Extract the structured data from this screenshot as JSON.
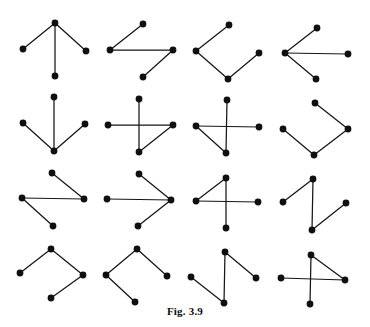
{
  "figure": {
    "caption": "Fig. 3.9",
    "canvas": {
      "width": 370,
      "height": 327
    },
    "style": {
      "vertex_color": "#101010",
      "edge_color": "#151515",
      "background_color": "#ffffff",
      "vertex_radius": 3.4,
      "edge_width": 1.25
    },
    "grid": {
      "rows": 4,
      "columns": 4
    },
    "graphs": [
      {
        "id": "graph-1",
        "row": 1,
        "column": 1,
        "shape": "star-down",
        "vertices": [
          {
            "name": "apex",
            "x": 55,
            "y": 23
          },
          {
            "name": "left",
            "x": 23,
            "y": 49
          },
          {
            "name": "right",
            "x": 86,
            "y": 51
          },
          {
            "name": "bottom",
            "x": 55,
            "y": 76
          }
        ],
        "edges": [
          [
            0,
            1
          ],
          [
            0,
            2
          ],
          [
            0,
            3
          ]
        ]
      },
      {
        "id": "graph-2",
        "row": 1,
        "column": 2,
        "shape": "zigzag-path",
        "vertices": [
          {
            "name": "top",
            "x": 143,
            "y": 24
          },
          {
            "name": "left",
            "x": 110,
            "y": 50
          },
          {
            "name": "right",
            "x": 173,
            "y": 50
          },
          {
            "name": "bottom",
            "x": 143,
            "y": 77
          }
        ],
        "edges": [
          [
            0,
            1
          ],
          [
            1,
            2
          ],
          [
            2,
            3
          ]
        ]
      },
      {
        "id": "graph-3",
        "row": 1,
        "column": 3,
        "shape": "open-v-path",
        "vertices": [
          {
            "name": "top",
            "x": 229,
            "y": 25
          },
          {
            "name": "left",
            "x": 196,
            "y": 51
          },
          {
            "name": "bottom",
            "x": 228,
            "y": 79
          },
          {
            "name": "right",
            "x": 259,
            "y": 53
          }
        ],
        "edges": [
          [
            0,
            1
          ],
          [
            1,
            2
          ],
          [
            2,
            3
          ]
        ]
      },
      {
        "id": "graph-4",
        "row": 1,
        "column": 4,
        "shape": "star-right",
        "vertices": [
          {
            "name": "center",
            "x": 285,
            "y": 53
          },
          {
            "name": "top",
            "x": 317,
            "y": 28
          },
          {
            "name": "right",
            "x": 348,
            "y": 54
          },
          {
            "name": "bottom",
            "x": 316,
            "y": 79
          }
        ],
        "edges": [
          [
            0,
            1
          ],
          [
            0,
            2
          ],
          [
            0,
            3
          ]
        ]
      },
      {
        "id": "graph-5",
        "row": 2,
        "column": 1,
        "shape": "star-up",
        "vertices": [
          {
            "name": "center",
            "x": 54,
            "y": 151
          },
          {
            "name": "top",
            "x": 54,
            "y": 97
          },
          {
            "name": "left",
            "x": 23,
            "y": 123
          },
          {
            "name": "right",
            "x": 85,
            "y": 124
          }
        ],
        "edges": [
          [
            0,
            1
          ],
          [
            0,
            2
          ],
          [
            0,
            3
          ]
        ]
      },
      {
        "id": "graph-6",
        "row": 2,
        "column": 2,
        "shape": "crossed-path",
        "vertices": [
          {
            "name": "top",
            "x": 139,
            "y": 99
          },
          {
            "name": "left",
            "x": 108,
            "y": 125
          },
          {
            "name": "right",
            "x": 173,
            "y": 125
          },
          {
            "name": "bottom",
            "x": 139,
            "y": 152
          }
        ],
        "edges": [
          [
            0,
            3
          ],
          [
            1,
            2
          ],
          [
            2,
            3
          ]
        ]
      },
      {
        "id": "graph-7",
        "row": 2,
        "column": 3,
        "shape": "crossed-path",
        "vertices": [
          {
            "name": "top",
            "x": 227,
            "y": 100
          },
          {
            "name": "left",
            "x": 196,
            "y": 126
          },
          {
            "name": "right",
            "x": 259,
            "y": 127
          },
          {
            "name": "bottom",
            "x": 226,
            "y": 153
          }
        ],
        "edges": [
          [
            0,
            3
          ],
          [
            1,
            2
          ],
          [
            1,
            3
          ]
        ]
      },
      {
        "id": "graph-8",
        "row": 2,
        "column": 4,
        "shape": "open-v-path",
        "vertices": [
          {
            "name": "top",
            "x": 315,
            "y": 103
          },
          {
            "name": "right",
            "x": 348,
            "y": 129
          },
          {
            "name": "bottom",
            "x": 314,
            "y": 155
          },
          {
            "name": "left",
            "x": 283,
            "y": 129
          }
        ],
        "edges": [
          [
            0,
            1
          ],
          [
            1,
            2
          ],
          [
            2,
            3
          ]
        ]
      },
      {
        "id": "graph-9",
        "row": 3,
        "column": 1,
        "shape": "zigzag-path",
        "vertices": [
          {
            "name": "top",
            "x": 52,
            "y": 173
          },
          {
            "name": "right",
            "x": 84,
            "y": 199
          },
          {
            "name": "left",
            "x": 22,
            "y": 198
          },
          {
            "name": "bottom",
            "x": 53,
            "y": 226
          }
        ],
        "edges": [
          [
            0,
            1
          ],
          [
            1,
            2
          ],
          [
            2,
            3
          ]
        ]
      },
      {
        "id": "graph-10",
        "row": 3,
        "column": 2,
        "shape": "star-left",
        "vertices": [
          {
            "name": "center",
            "x": 171,
            "y": 200
          },
          {
            "name": "top",
            "x": 139,
            "y": 174
          },
          {
            "name": "left",
            "x": 107,
            "y": 199
          },
          {
            "name": "bottom",
            "x": 138,
            "y": 226
          }
        ],
        "edges": [
          [
            0,
            1
          ],
          [
            0,
            2
          ],
          [
            0,
            3
          ]
        ]
      },
      {
        "id": "graph-11",
        "row": 3,
        "column": 3,
        "shape": "crossed-path",
        "vertices": [
          {
            "name": "top",
            "x": 226,
            "y": 178
          },
          {
            "name": "left",
            "x": 196,
            "y": 201
          },
          {
            "name": "right",
            "x": 258,
            "y": 202
          },
          {
            "name": "bottom",
            "x": 226,
            "y": 228
          }
        ],
        "edges": [
          [
            0,
            3
          ],
          [
            1,
            2
          ],
          [
            0,
            1
          ]
        ]
      },
      {
        "id": "graph-12",
        "row": 3,
        "column": 4,
        "shape": "zigzag-path",
        "vertices": [
          {
            "name": "top",
            "x": 313,
            "y": 179
          },
          {
            "name": "left",
            "x": 283,
            "y": 202
          },
          {
            "name": "bottom",
            "x": 312,
            "y": 230
          },
          {
            "name": "right",
            "x": 346,
            "y": 203
          }
        ],
        "edges": [
          [
            1,
            0
          ],
          [
            0,
            2
          ],
          [
            2,
            3
          ]
        ]
      },
      {
        "id": "graph-13",
        "row": 4,
        "column": 1,
        "shape": "open-v-path",
        "vertices": [
          {
            "name": "left",
            "x": 20,
            "y": 273
          },
          {
            "name": "top",
            "x": 51,
            "y": 249
          },
          {
            "name": "right",
            "x": 83,
            "y": 275
          },
          {
            "name": "bottom",
            "x": 51,
            "y": 298
          }
        ],
        "edges": [
          [
            0,
            1
          ],
          [
            1,
            2
          ],
          [
            2,
            3
          ]
        ]
      },
      {
        "id": "graph-14",
        "row": 4,
        "column": 2,
        "shape": "open-path",
        "vertices": [
          {
            "name": "top",
            "x": 137,
            "y": 249
          },
          {
            "name": "left",
            "x": 106,
            "y": 275
          },
          {
            "name": "bottom",
            "x": 135,
            "y": 302
          },
          {
            "name": "right",
            "x": 167,
            "y": 276
          }
        ],
        "edges": [
          [
            0,
            1
          ],
          [
            1,
            2
          ],
          [
            0,
            3
          ]
        ]
      },
      {
        "id": "graph-15",
        "row": 4,
        "column": 3,
        "shape": "zigzag-path",
        "vertices": [
          {
            "name": "top",
            "x": 225,
            "y": 252
          },
          {
            "name": "left",
            "x": 191,
            "y": 277
          },
          {
            "name": "bottom",
            "x": 224,
            "y": 303
          },
          {
            "name": "right",
            "x": 256,
            "y": 278
          }
        ],
        "edges": [
          [
            1,
            2
          ],
          [
            2,
            0
          ],
          [
            0,
            3
          ]
        ]
      },
      {
        "id": "graph-16",
        "row": 4,
        "column": 4,
        "shape": "crossed-path",
        "vertices": [
          {
            "name": "top",
            "x": 311,
            "y": 255
          },
          {
            "name": "left",
            "x": 281,
            "y": 278
          },
          {
            "name": "right",
            "x": 345,
            "y": 280
          },
          {
            "name": "bottom",
            "x": 310,
            "y": 304
          }
        ],
        "edges": [
          [
            0,
            3
          ],
          [
            1,
            2
          ],
          [
            0,
            2
          ]
        ]
      }
    ]
  }
}
